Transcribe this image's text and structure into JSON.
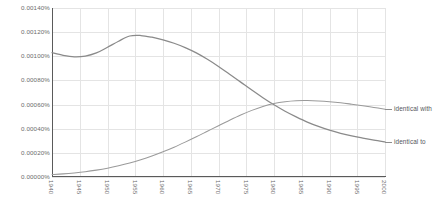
{
  "chart_data": {
    "type": "line",
    "title": "",
    "xlabel": "",
    "ylabel": "",
    "xlim": [
      1940,
      2000
    ],
    "ylim": [
      0.0,
      0.0014
    ],
    "grid": true,
    "legend_position": "right-inline",
    "x_tick_labels": [
      "1940",
      "1945",
      "1950",
      "1955",
      "1960",
      "1965",
      "1970",
      "1975",
      "1980",
      "1985",
      "1990",
      "1995",
      "2000"
    ],
    "y_tick_labels": [
      "0.00000%",
      "0.00020%",
      "0.00040%",
      "0.00060%",
      "0.00080%",
      "0.00100%",
      "0.00120%",
      "0.00140%"
    ],
    "y_tick_values": [
      0.0,
      0.0002,
      0.0004,
      0.0006,
      0.0008,
      0.001,
      0.0012,
      0.0014
    ],
    "x": [
      1940,
      1942,
      1944,
      1946,
      1948,
      1950,
      1952,
      1954,
      1956,
      1958,
      1960,
      1962,
      1964,
      1966,
      1968,
      1970,
      1972,
      1974,
      1976,
      1978,
      1980,
      1982,
      1984,
      1986,
      1988,
      1990,
      1992,
      1994,
      1996,
      1998,
      2000
    ],
    "series": [
      {
        "name": "identical to",
        "color": "#8a8a8a",
        "values": [
          0.00103,
          0.001008,
          0.000996,
          0.001002,
          0.001028,
          0.001075,
          0.001125,
          0.001168,
          0.001172,
          0.001158,
          0.001136,
          0.001108,
          0.001072,
          0.001028,
          0.000975,
          0.000916,
          0.000852,
          0.000786,
          0.00072,
          0.000657,
          0.000598,
          0.000545,
          0.000498,
          0.000455,
          0.000419,
          0.000388,
          0.000362,
          0.00034,
          0.000322,
          0.000305,
          0.00029
        ]
      },
      {
        "name": "identical with",
        "color": "#9a9a9a",
        "values": [
          2e-05,
          2.6e-05,
          3.4e-05,
          4.4e-05,
          5.7e-05,
          7.3e-05,
          9.3e-05,
          0.000116,
          0.000143,
          0.000174,
          0.000209,
          0.000247,
          0.000289,
          0.000333,
          0.000379,
          0.000425,
          0.00047,
          0.000513,
          0.000552,
          0.000585,
          0.000609,
          0.000624,
          0.000632,
          0.000633,
          0.00063,
          0.000624,
          0.000615,
          0.000603,
          0.00059,
          0.000576,
          0.000562
        ]
      }
    ]
  },
  "legend": {
    "items": [
      {
        "label": "identical to"
      },
      {
        "label": "identical with"
      }
    ]
  }
}
